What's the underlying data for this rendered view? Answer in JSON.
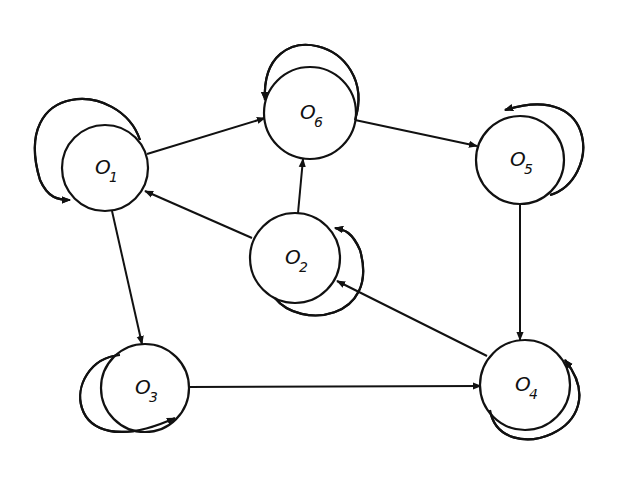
{
  "diagram": {
    "title": "",
    "stroke_color": "#111111",
    "background": "#ffffff",
    "nodes": [
      {
        "id": "O1",
        "letter": "O",
        "sub": "1",
        "cx": 105,
        "cy": 168,
        "r": 43
      },
      {
        "id": "O6",
        "letter": "O",
        "sub": "6",
        "cx": 310,
        "cy": 113,
        "r": 46
      },
      {
        "id": "O5",
        "letter": "O",
        "sub": "5",
        "cx": 520,
        "cy": 160,
        "r": 44
      },
      {
        "id": "O2",
        "letter": "O",
        "sub": "2",
        "cx": 295,
        "cy": 258,
        "r": 45
      },
      {
        "id": "O3",
        "letter": "O",
        "sub": "3",
        "cx": 145,
        "cy": 388,
        "r": 44
      },
      {
        "id": "O4",
        "letter": "O",
        "sub": "4",
        "cx": 525,
        "cy": 385,
        "r": 45
      }
    ],
    "self_loops": [
      {
        "node": "O1",
        "path": "M 140 140 C 120 80, 10 80, 40 180 C 48 198, 58 200, 70 200"
      },
      {
        "node": "O6",
        "path": "M 355 120 C 380 40, 260 10, 265 100"
      },
      {
        "node": "O5",
        "path": "M 550 195 C 600 180, 600 80, 505 110"
      },
      {
        "node": "O2",
        "path": "M 275 298 C 300 330, 380 320, 360 250 C 352 232, 345 230, 335 228"
      },
      {
        "node": "O3",
        "path": "M 120 355 C 60 360, 60 470, 175 418"
      },
      {
        "node": "O4",
        "path": "M 490 410 C 500 470, 620 430, 565 360"
      }
    ],
    "edges": [
      {
        "from": "O1",
        "to": "O6",
        "x1": 147,
        "y1": 154,
        "x2": 265,
        "y2": 118
      },
      {
        "from": "O6",
        "to": "O5",
        "x1": 355,
        "y1": 120,
        "x2": 477,
        "y2": 146
      },
      {
        "from": "O6",
        "to": "O2",
        "note": "O2 to O6",
        "x1": 298,
        "y1": 213,
        "x2": 303,
        "y2": 159
      },
      {
        "from": "O2",
        "to": "O1",
        "x1": 252,
        "y1": 238,
        "x2": 145,
        "y2": 191
      },
      {
        "from": "O1",
        "to": "O3",
        "x1": 112,
        "y1": 211,
        "x2": 142,
        "y2": 344
      },
      {
        "from": "O3",
        "to": "O4",
        "x1": 189,
        "y1": 387,
        "x2": 481,
        "y2": 386
      },
      {
        "from": "O5",
        "to": "O4",
        "x1": 520,
        "y1": 204,
        "x2": 520,
        "y2": 340
      },
      {
        "from": "O4",
        "to": "O2",
        "x1": 487,
        "y1": 356,
        "x2": 337,
        "y2": 281
      }
    ]
  }
}
